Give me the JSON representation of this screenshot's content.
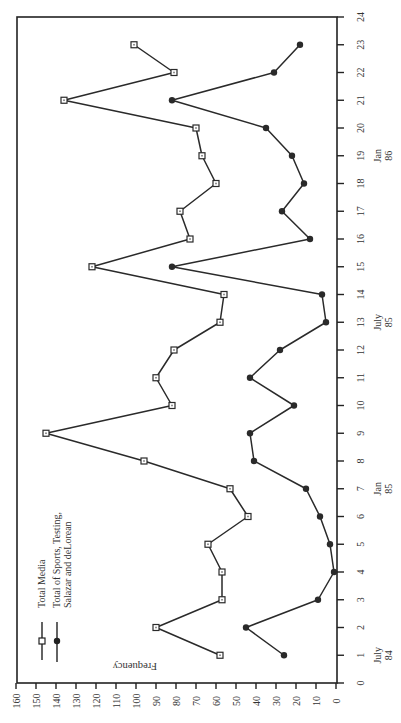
{
  "chart_data": {
    "type": "line",
    "orientation": "rotated 90 degrees clockwise (x-axis runs bottom-to-top along right edge, y-axis runs right-to-left along bottom edge)",
    "title": "",
    "xlabel": "",
    "ylabel": "Frequency",
    "xlim": [
      0,
      24
    ],
    "ylim": [
      0,
      160
    ],
    "x_ticks": [
      0,
      1,
      2,
      3,
      4,
      5,
      6,
      7,
      8,
      9,
      10,
      11,
      12,
      13,
      14,
      15,
      16,
      17,
      18,
      19,
      20,
      21,
      22,
      23,
      24
    ],
    "y_ticks": [
      0,
      10,
      20,
      30,
      40,
      50,
      60,
      70,
      80,
      90,
      100,
      110,
      120,
      130,
      140,
      150,
      160
    ],
    "date_annotations": [
      {
        "x": 1,
        "line1": "July",
        "line2": "84"
      },
      {
        "x": 7,
        "line1": "Jan",
        "line2": "85"
      },
      {
        "x": 13,
        "line1": "July",
        "line2": "85"
      },
      {
        "x": 19,
        "line1": "Jan",
        "line2": "86"
      }
    ],
    "grid": false,
    "legend_position": "upper-left (rotated)",
    "x": [
      1,
      2,
      3,
      4,
      5,
      6,
      7,
      8,
      9,
      10,
      11,
      12,
      13,
      14,
      15,
      16,
      17,
      18,
      19,
      20,
      21,
      22,
      23
    ],
    "series": [
      {
        "name": "Total Media",
        "marker": "open-square",
        "values": [
          58,
          90,
          57,
          57,
          64,
          44,
          53,
          96,
          145,
          82,
          90,
          81,
          58,
          56,
          122,
          73,
          78,
          60,
          67,
          70,
          136,
          81,
          101
        ]
      },
      {
        "name": "Total of Sports, Testing, Salazar and deLorean",
        "marker": "filled-circle",
        "values": [
          26,
          45,
          9,
          1,
          3,
          8,
          15,
          41,
          43,
          21,
          43,
          28,
          5,
          7,
          82,
          13,
          27,
          16,
          22,
          35,
          82,
          31,
          18
        ]
      }
    ]
  },
  "legend": {
    "items": [
      {
        "label_line1": "Total Media",
        "label_line2": "",
        "label_line3": ""
      },
      {
        "label_line1": "Total of Sports, Testing,",
        "label_line2": "Salazar and deLorean",
        "label_line3": ""
      }
    ]
  },
  "axis": {
    "y_title": "Frequency"
  },
  "style": {
    "line_color": "#2a2a2a",
    "frame_color": "#222222",
    "background": "#ffffff"
  }
}
